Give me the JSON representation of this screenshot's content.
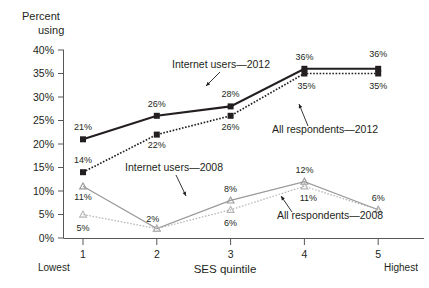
{
  "chart_data": {
    "type": "line",
    "title": "",
    "ylabel": "Percent using",
    "xlabel": "SES quintile",
    "categories": [
      "1",
      "2",
      "3",
      "4",
      "5"
    ],
    "x_end_labels": {
      "low": "Lowest",
      "high": "Highest"
    },
    "ylim": [
      0,
      40
    ],
    "y_ticks": [
      "0%",
      "5%",
      "10%",
      "15%",
      "20%",
      "25%",
      "30%",
      "35%",
      "40%"
    ],
    "y_tick_values": [
      0,
      5,
      10,
      15,
      20,
      25,
      30,
      35,
      40
    ],
    "grid": false,
    "legend_position": "inline-annotations",
    "series": [
      {
        "name": "Internet users—2012",
        "values": [
          21,
          26,
          28,
          36,
          36
        ],
        "value_labels": [
          "21%",
          "26%",
          "28%",
          "36%",
          "36%"
        ],
        "color": "#231f20",
        "style": "solid",
        "marker": "square"
      },
      {
        "name": "All respondents—2012",
        "values": [
          14,
          22,
          26,
          35,
          35
        ],
        "value_labels": [
          "14%",
          "22%",
          "26%",
          "35%",
          "35%"
        ],
        "color": "#231f20",
        "style": "dotted",
        "marker": "square"
      },
      {
        "name": "Internet users—2008",
        "values": [
          11,
          2,
          8,
          12,
          6
        ],
        "value_labels": [
          "11%",
          "2%",
          "8%",
          "12%",
          "6%"
        ],
        "color": "#9a9a9a",
        "style": "solid",
        "marker": "triangle"
      },
      {
        "name": "All respondents—2008",
        "values": [
          5,
          2,
          6,
          11,
          6
        ],
        "value_labels": [
          "5%",
          "2%",
          "6%",
          "11%",
          "6%"
        ],
        "color": "#b5b5b5",
        "style": "dotted",
        "marker": "triangle"
      }
    ],
    "annotations": [
      {
        "text": "Internet users—2012",
        "x": 221,
        "y": 68
      },
      {
        "text": "All respondents—2012",
        "x": 325,
        "y": 133
      },
      {
        "text": "Internet users—2008",
        "x": 174,
        "y": 171
      },
      {
        "text": "All respondents—2008",
        "x": 330,
        "y": 219
      }
    ]
  },
  "axis": {
    "y_title_line1": "Percent",
    "y_title_line2": "using"
  }
}
